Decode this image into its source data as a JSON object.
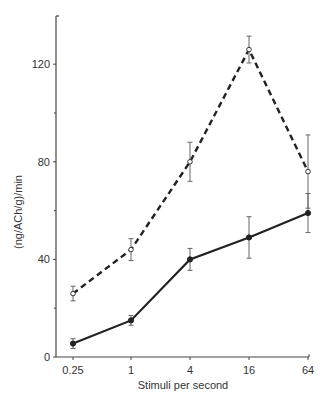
{
  "chart_data": {
    "type": "line",
    "title": "",
    "xlabel": "Stimuli per second",
    "ylabel": "(ng/ACh/g)/min",
    "x_scale": "log",
    "categories": [
      "0.25",
      "1",
      "4",
      "16",
      "64"
    ],
    "x": [
      0.25,
      1,
      4,
      16,
      64
    ],
    "ylim": [
      0,
      140
    ],
    "yticks": [
      0,
      40,
      80,
      120
    ],
    "yticks_minor": [
      20,
      60,
      100
    ],
    "grid": false,
    "legend": null,
    "series": [
      {
        "name": "open circles (dashed)",
        "marker": "open-circle",
        "line_style": "dashed",
        "values": [
          26,
          44,
          80,
          126,
          76
        ],
        "errors": [
          3,
          4.5,
          8,
          5.5,
          15
        ]
      },
      {
        "name": "filled circles (solid)",
        "marker": "filled-circle",
        "line_style": "solid",
        "values": [
          5.5,
          15,
          40,
          49,
          59
        ],
        "errors": [
          2,
          2,
          4.5,
          8.5,
          8
        ]
      }
    ]
  }
}
